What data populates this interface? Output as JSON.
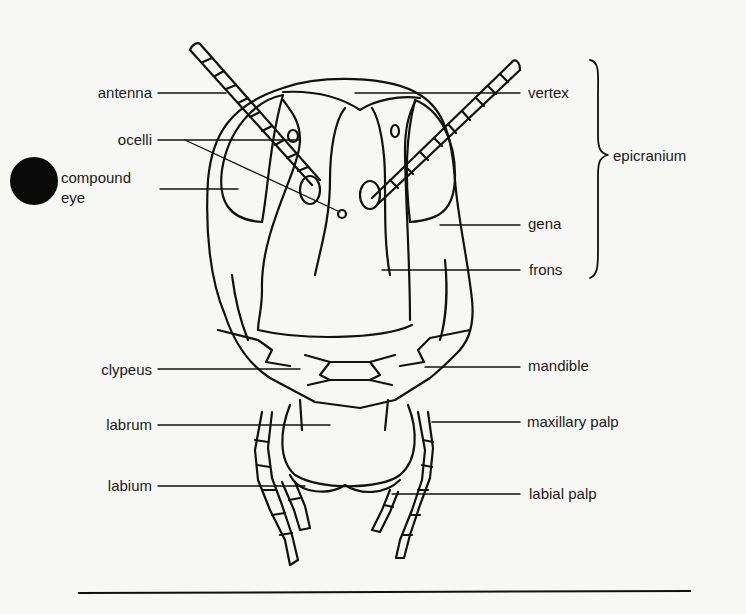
{
  "diagram": {
    "colors": {
      "background": "#f7f7f5",
      "ink": "#1a1a1a"
    },
    "labels_left": [
      {
        "id": "antenna",
        "text": "antenna"
      },
      {
        "id": "ocelli",
        "text": "ocelli"
      },
      {
        "id": "compound_eye",
        "text": "compound",
        "text2": "eye"
      },
      {
        "id": "clypeus",
        "text": "clypeus"
      },
      {
        "id": "labrum",
        "text": "labrum"
      },
      {
        "id": "labium",
        "text": "labium"
      }
    ],
    "labels_right": [
      {
        "id": "vertex",
        "text": "vertex"
      },
      {
        "id": "gena",
        "text": "gena"
      },
      {
        "id": "frons",
        "text": "frons"
      },
      {
        "id": "mandible",
        "text": "mandible"
      },
      {
        "id": "maxillary_palp",
        "text": "maxillary palp"
      },
      {
        "id": "labial_palp",
        "text": "labial palp"
      }
    ],
    "bracket_group": {
      "text": "epicranium",
      "covers": [
        "vertex",
        "gena",
        "frons"
      ]
    }
  }
}
